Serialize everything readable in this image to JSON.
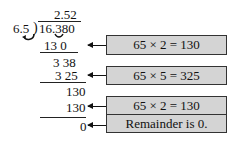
{
  "division": {
    "quotient": "2.52",
    "divisor": "6.5",
    "bracket": ")",
    "dividend": "16.380",
    "steps": [
      {
        "product": "13 0",
        "remainder": "3 38"
      },
      {
        "product": "3 25",
        "remainder": "130"
      },
      {
        "product": "130",
        "remainder": "0"
      }
    ]
  },
  "annotations": [
    {
      "label": "65 × 2 = 130"
    },
    {
      "label": "65 × 5 = 325"
    },
    {
      "label": "65 × 2 = 130"
    },
    {
      "label": "Remainder is 0."
    }
  ],
  "colors": {
    "box_fill": "#d4d4d4",
    "box_border": "#333333",
    "ink": "#111111"
  }
}
